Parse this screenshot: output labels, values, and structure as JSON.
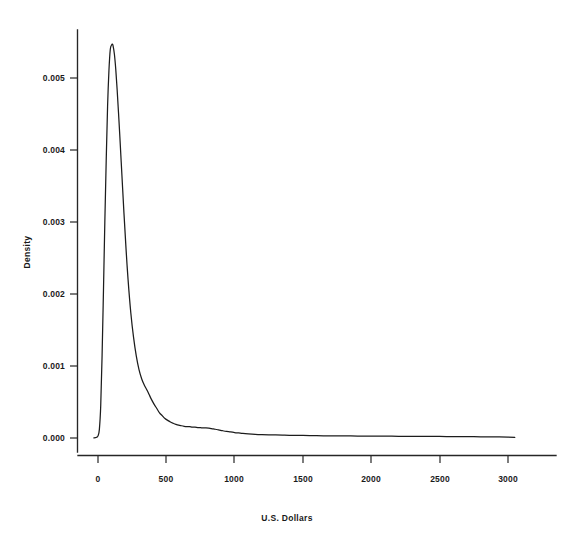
{
  "chart_data": {
    "type": "line",
    "title": "",
    "subtitle": "",
    "xlabel": "U.S. Dollars",
    "ylabel": "Density",
    "xlim": [
      -120,
      3220
    ],
    "ylim": [
      -0.00018,
      0.00575
    ],
    "grid": false,
    "legend": null,
    "xticks": [
      0,
      500,
      1000,
      1500,
      2000,
      2500,
      3000
    ],
    "xtick_labels": [
      "0",
      "500",
      "1000",
      "1500",
      "2000",
      "2500",
      "3000"
    ],
    "yticks": [
      0.0,
      0.001,
      0.002,
      0.003,
      0.004,
      0.005
    ],
    "ytick_labels": [
      "0.000",
      "0.001",
      "0.002",
      "0.003",
      "0.004",
      "0.005"
    ],
    "series": [
      {
        "name": "Density",
        "color": "#1c1c1c",
        "x": [
          -30,
          -20,
          -10,
          0,
          10,
          20,
          30,
          40,
          50,
          60,
          70,
          80,
          90,
          100,
          105,
          110,
          120,
          130,
          140,
          150,
          160,
          175,
          190,
          205,
          220,
          240,
          260,
          280,
          300,
          320,
          340,
          360,
          375,
          390,
          410,
          430,
          450,
          470,
          490,
          510,
          530,
          550,
          570,
          590,
          610,
          630,
          650,
          670,
          690,
          710,
          730,
          750,
          770,
          790,
          810,
          830,
          850,
          870,
          890,
          910,
          940,
          970,
          1000,
          1030,
          1060,
          1100,
          1150,
          1200,
          1250,
          1300,
          1350,
          1400,
          1500,
          1600,
          1700,
          1800,
          1900,
          2000,
          2100,
          2200,
          2300,
          2400,
          2500,
          2600,
          2700,
          2800,
          2900,
          3000,
          3050
        ],
        "y": [
          2e-06,
          4e-06,
          1e-05,
          3e-05,
          0.00012,
          0.00045,
          0.00115,
          0.00205,
          0.003,
          0.00385,
          0.0046,
          0.0051,
          0.0054,
          0.00546,
          0.00547,
          0.00545,
          0.00533,
          0.00512,
          0.00484,
          0.00452,
          0.00418,
          0.00365,
          0.00312,
          0.00263,
          0.0022,
          0.00174,
          0.0014,
          0.00114,
          0.00095,
          0.00082,
          0.00073,
          0.00066,
          0.0006,
          0.00054,
          0.00047,
          0.00041,
          0.00035,
          0.00031,
          0.00027,
          0.000245,
          0.000222,
          0.000205,
          0.00019,
          0.000178,
          0.00017,
          0.000163,
          0.000158,
          0.000157,
          0.00015,
          0.00015,
          0.000145,
          0.000143,
          0.00014,
          0.000142,
          0.000138,
          0.00013,
          0.000124,
          0.000118,
          0.00011,
          0.000102,
          9.2e-05,
          8.5e-05,
          7.6e-05,
          7e-05,
          6.4e-05,
          5.8e-05,
          5.2e-05,
          4.8e-05,
          4.5e-05,
          4.2e-05,
          4e-05,
          3.8e-05,
          3.5e-05,
          3.2e-05,
          3e-05,
          2.9e-05,
          2.7e-05,
          2.6e-05,
          2.5e-05,
          2.4e-05,
          2.3e-05,
          2.2e-05,
          2.1e-05,
          2e-05,
          1.9e-05,
          1.7e-05,
          1.5e-05,
          1.2e-05,
          1e-05
        ]
      }
    ],
    "annotations": [],
    "peak": {
      "x": 105,
      "y": 0.00547
    },
    "colors": {
      "line": "#1c1c1c",
      "axis": "#262626",
      "background": "#ffffff"
    }
  },
  "axes": {
    "x_title": "U.S. Dollars",
    "y_title": "Density"
  }
}
